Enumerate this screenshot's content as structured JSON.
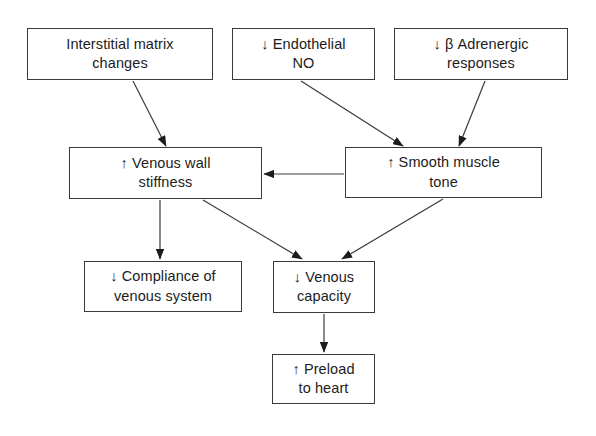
{
  "diagram": {
    "background_color": "#ffffff",
    "line_color": "#3a3a3a",
    "text_color": "#1c1c1c",
    "nodes": [
      {
        "id": "interstitial-matrix-changes",
        "label": "Interstitial matrix\nchanges",
        "x": 27,
        "y": 28,
        "width": 186,
        "height": 52
      },
      {
        "id": "endothelial-no",
        "label": "↓ Endothelial\nNO",
        "x": 232,
        "y": 28,
        "width": 143,
        "height": 52
      },
      {
        "id": "beta-adrenergic-responses",
        "label": "↓ β Adrenergic\nresponses",
        "x": 394,
        "y": 28,
        "width": 174,
        "height": 52
      },
      {
        "id": "venous-wall-stiffness",
        "label": "↑ Venous wall\nstiffness",
        "x": 69,
        "y": 147,
        "width": 193,
        "height": 52
      },
      {
        "id": "smooth-muscle-tone",
        "label": "↑ Smooth muscle\ntone",
        "x": 345,
        "y": 147,
        "width": 197,
        "height": 51
      },
      {
        "id": "compliance-of-venous-system",
        "label": "↓ Compliance of\nvenous system",
        "x": 84,
        "y": 261,
        "width": 158,
        "height": 51
      },
      {
        "id": "venous-capacity",
        "label": "↓ Venous\ncapacity",
        "x": 273,
        "y": 261,
        "width": 102,
        "height": 52
      },
      {
        "id": "preload-to-heart",
        "label": "↑ Preload\nto heart",
        "x": 272,
        "y": 354,
        "width": 103,
        "height": 50
      }
    ],
    "edges": [
      {
        "id": "edge-matrix-to-stiffness",
        "from": "interstitial-matrix-changes",
        "to": "venous-wall-stiffness",
        "x1": 133,
        "y1": 81,
        "x2": 166,
        "y2": 146
      },
      {
        "id": "edge-no-to-tone",
        "from": "endothelial-no",
        "to": "smooth-muscle-tone",
        "x1": 301,
        "y1": 81,
        "x2": 403,
        "y2": 146
      },
      {
        "id": "edge-beta-to-tone",
        "from": "beta-adrenergic-responses",
        "to": "smooth-muscle-tone",
        "x1": 485,
        "y1": 81,
        "x2": 459,
        "y2": 146
      },
      {
        "id": "edge-tone-to-stiffness",
        "from": "smooth-muscle-tone",
        "to": "venous-wall-stiffness",
        "x1": 344,
        "y1": 174,
        "x2": 264,
        "y2": 174
      },
      {
        "id": "edge-stiffness-to-compliance",
        "from": "venous-wall-stiffness",
        "to": "compliance-of-venous-system",
        "x1": 160,
        "y1": 200,
        "x2": 160,
        "y2": 259
      },
      {
        "id": "edge-stiffness-to-capacity",
        "from": "venous-wall-stiffness",
        "to": "venous-capacity",
        "x1": 203,
        "y1": 200,
        "x2": 302,
        "y2": 259
      },
      {
        "id": "edge-tone-to-capacity",
        "from": "smooth-muscle-tone",
        "to": "venous-capacity",
        "x1": 443,
        "y1": 199,
        "x2": 342,
        "y2": 259
      },
      {
        "id": "edge-capacity-to-preload",
        "from": "venous-capacity",
        "to": "preload-to-heart",
        "x1": 324,
        "y1": 314,
        "x2": 324,
        "y2": 352
      }
    ]
  }
}
